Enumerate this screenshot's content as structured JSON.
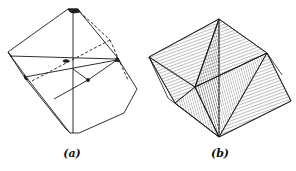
{
  "figure": {
    "panels": [
      {
        "id": "a",
        "label": "(a)",
        "description": "Cube-like crystal with truncated corners, showing internal axes and dashed hidden edges"
      },
      {
        "id": "b",
        "label": "(b)",
        "description": "Octahedron inscribed in a prism, faces shaded with hatching"
      }
    ]
  },
  "colors": {
    "line": "#1a1a1a",
    "background": "#ffffff",
    "hatch": "#555555"
  }
}
